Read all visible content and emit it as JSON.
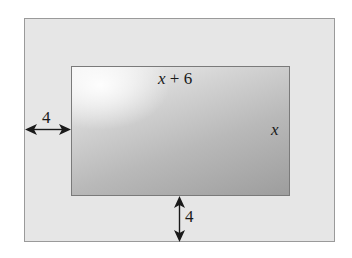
{
  "figure": {
    "outer_region": {
      "fill": "#e6e6e6",
      "border": "#9a9a9a"
    },
    "inner_rectangle": {
      "width_label_var": "x",
      "width_label_rest": " + 6",
      "height_label": "x",
      "gradient_light": "#f2f2f2",
      "gradient_dark": "#9d9d9d"
    },
    "dimensions": {
      "left_border_label": "4",
      "bottom_border_label": "4"
    },
    "arrow_color": "#1a1a1a"
  }
}
